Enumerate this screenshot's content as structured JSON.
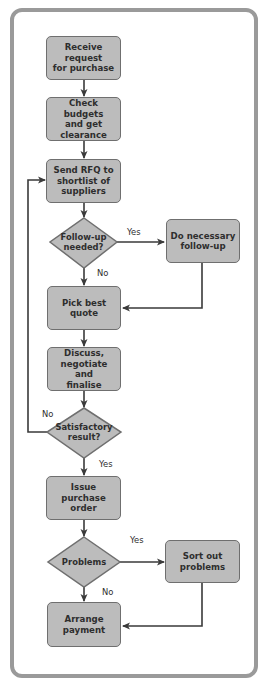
{
  "diagram": {
    "type": "flowchart",
    "title": "",
    "colors": {
      "box_fill": "#bcbcbc",
      "box_border": "#6f6f6f",
      "frame_border": "#9a9a9a",
      "connector": "#3a3a3a"
    },
    "nodes": [
      {
        "id": "n1",
        "shape": "process",
        "label": "Receive request\nfor purchase"
      },
      {
        "id": "n2",
        "shape": "process",
        "label": "Check budgets\nand get\nclearance"
      },
      {
        "id": "n3",
        "shape": "process",
        "label": "Send RFQ to\nshortlist of\nsuppliers"
      },
      {
        "id": "d1",
        "shape": "decision",
        "label": "Follow-up\nneeded?"
      },
      {
        "id": "n4",
        "shape": "process",
        "label": "Do necessary\nfollow-up"
      },
      {
        "id": "n5",
        "shape": "process",
        "label": "Pick best quote"
      },
      {
        "id": "n6",
        "shape": "process",
        "label": "Discuss,\nnegotiate and\nfinalise"
      },
      {
        "id": "d2",
        "shape": "decision",
        "label": "Satisfactory\nresult?"
      },
      {
        "id": "n7",
        "shape": "process",
        "label": "Issue\npurchase order"
      },
      {
        "id": "d3",
        "shape": "decision",
        "label": "Problems"
      },
      {
        "id": "n8",
        "shape": "process",
        "label": "Sort out\nproblems"
      },
      {
        "id": "n9",
        "shape": "process",
        "label": "Arrange\npayment"
      }
    ],
    "edges": [
      {
        "from": "n1",
        "to": "n2",
        "label": ""
      },
      {
        "from": "n2",
        "to": "n3",
        "label": ""
      },
      {
        "from": "n3",
        "to": "d1",
        "label": ""
      },
      {
        "from": "d1",
        "to": "n4",
        "label": "Yes"
      },
      {
        "from": "d1",
        "to": "n5",
        "label": "No"
      },
      {
        "from": "n4",
        "to": "n5",
        "label": ""
      },
      {
        "from": "n5",
        "to": "n6",
        "label": ""
      },
      {
        "from": "n6",
        "to": "d2",
        "label": ""
      },
      {
        "from": "d2",
        "to": "n3",
        "label": "No"
      },
      {
        "from": "d2",
        "to": "n7",
        "label": "Yes"
      },
      {
        "from": "n7",
        "to": "d3",
        "label": ""
      },
      {
        "from": "d3",
        "to": "n8",
        "label": "Yes"
      },
      {
        "from": "d3",
        "to": "n9",
        "label": "No"
      },
      {
        "from": "n8",
        "to": "n9",
        "label": ""
      }
    ]
  }
}
